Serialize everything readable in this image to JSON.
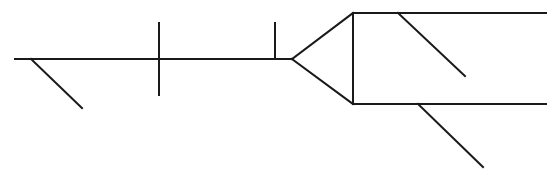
{
  "diagram": {
    "type": "sentence-diagram",
    "width": 551,
    "height": 178,
    "stroke_color": "#1a1a1a",
    "background": "#ffffff",
    "labels": [],
    "segments": [
      {
        "name": "baseline",
        "x1": 15,
        "y1": 59,
        "x2": 292,
        "y2": 59
      },
      {
        "name": "subject-modifier-slant",
        "x1": 31,
        "y1": 59,
        "x2": 82,
        "y2": 108
      },
      {
        "name": "subject-verb-divider",
        "x1": 159,
        "y1": 23,
        "x2": 159,
        "y2": 95
      },
      {
        "name": "verb-object-divider",
        "x1": 275,
        "y1": 23,
        "x2": 275,
        "y2": 59
      },
      {
        "name": "fork-upper",
        "x1": 292,
        "y1": 59,
        "x2": 353,
        "y2": 13
      },
      {
        "name": "fork-lower",
        "x1": 292,
        "y1": 59,
        "x2": 353,
        "y2": 104
      },
      {
        "name": "conjunction-line",
        "x1": 353,
        "y1": 13,
        "x2": 353,
        "y2": 104
      },
      {
        "name": "upper-branch",
        "x1": 353,
        "y1": 13,
        "x2": 546,
        "y2": 13
      },
      {
        "name": "upper-branch-modifier-slant",
        "x1": 398,
        "y1": 13,
        "x2": 465,
        "y2": 76
      },
      {
        "name": "lower-branch",
        "x1": 353,
        "y1": 104,
        "x2": 546,
        "y2": 104
      },
      {
        "name": "lower-branch-modifier-slant",
        "x1": 418,
        "y1": 104,
        "x2": 483,
        "y2": 167
      }
    ]
  }
}
